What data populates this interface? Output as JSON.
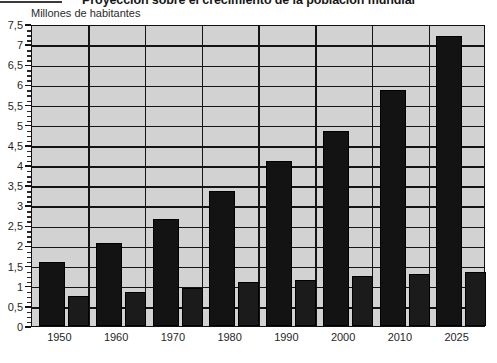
{
  "chart_data": {
    "type": "bar",
    "title": "Proyección sobre el crecimiento de la población mundial",
    "subtitle": "",
    "ylabel": "Millones de habitantes",
    "xlabel": "",
    "categories": [
      "1950",
      "1960",
      "1970",
      "1980",
      "1990",
      "2000",
      "2010",
      "2025"
    ],
    "series": [
      {
        "name": "serie-1",
        "color": "#131313",
        "values": [
          1.6,
          2.05,
          2.65,
          3.35,
          4.1,
          4.85,
          5.85,
          7.2
        ]
      },
      {
        "name": "serie-2",
        "color": "#1b1b1b",
        "values": [
          0.75,
          0.85,
          0.95,
          1.1,
          1.15,
          1.25,
          1.3,
          1.35
        ]
      }
    ],
    "ylim": [
      0,
      7.5
    ],
    "ytick_labels": [
      "0",
      "0,5",
      "1",
      "1,5",
      "2",
      "2,5",
      "3",
      "3,5",
      "4",
      "4,5",
      "5",
      "5,5",
      "6",
      "6,5",
      "7",
      "7,5"
    ],
    "ytick_values": [
      0,
      0.5,
      1,
      1.5,
      2,
      2.5,
      3,
      3.5,
      4,
      4.5,
      5,
      5.5,
      6,
      6.5,
      7,
      7.5
    ],
    "grid": true,
    "grid_major_step": 0.5,
    "legend_position": "none",
    "plot_background": "#d2d2d2",
    "axis_color": "#141414"
  }
}
